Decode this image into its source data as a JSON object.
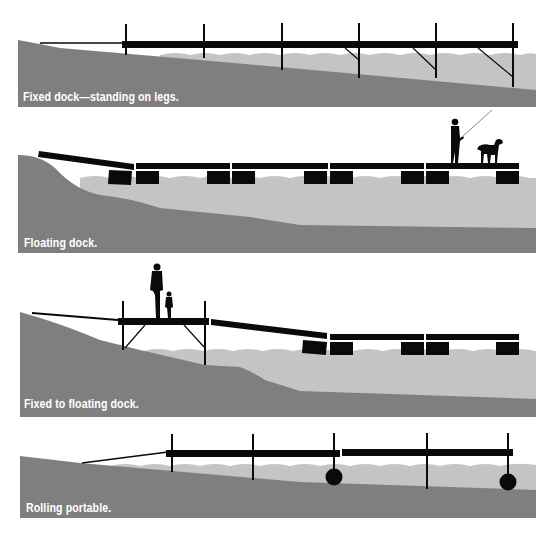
{
  "colors": {
    "ground": "#7f7f7f",
    "water": "#c4c4c4",
    "dock": "#0a0a0a",
    "background": "#ffffff",
    "caption_text": "#ffffff"
  },
  "panels": [
    {
      "id": "fixed",
      "caption": "Fixed dock—standing on legs."
    },
    {
      "id": "floating",
      "caption": "Floating dock."
    },
    {
      "id": "fixed-to-floating",
      "caption": "Fixed to floating dock."
    },
    {
      "id": "rolling",
      "caption": "Rolling portable."
    }
  ]
}
